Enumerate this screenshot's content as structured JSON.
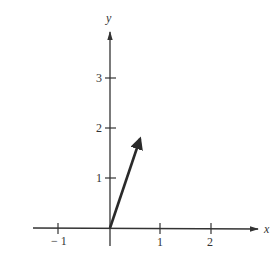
{
  "diagram": {
    "type": "vector-on-axes",
    "axes": {
      "x_label": "x",
      "y_label": "y",
      "x_ticks": [
        {
          "value": -1,
          "label": "− 1"
        },
        {
          "value": 1,
          "label": "1"
        },
        {
          "value": 2,
          "label": "2"
        }
      ],
      "y_ticks": [
        {
          "value": 1,
          "label": "1"
        },
        {
          "value": 2,
          "label": "2"
        },
        {
          "value": 3,
          "label": "3"
        }
      ],
      "x_range": [
        -1.5,
        2.95
      ],
      "y_range": [
        -0.2,
        3.85
      ]
    },
    "vector": {
      "tail": [
        0,
        0
      ],
      "head": [
        0.63,
        1.83
      ]
    },
    "colors": {
      "axis": "#333333",
      "vector": "#2a2a2a",
      "background": "#ffffff"
    }
  }
}
